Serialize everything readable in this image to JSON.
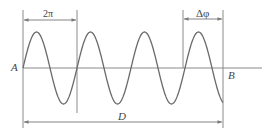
{
  "diagram": {
    "type": "sine-wave-phase-diagram",
    "labels": {
      "start_point": "A",
      "end_point": "B",
      "period": "2π",
      "phase_shift": "Δφ",
      "distance": "D"
    },
    "geometry": {
      "axis_y": 68,
      "wave_start_x": 23,
      "wave_end_x": 223,
      "period_px": 54,
      "amplitude_px": 36,
      "axis_end_x": 262
    },
    "colors": {
      "stroke": "#6e6e6e",
      "text": "#444444",
      "background": "#ffffff"
    }
  }
}
